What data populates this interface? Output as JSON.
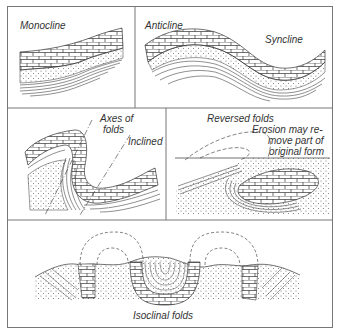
{
  "figure": {
    "panels": [
      {
        "id": "monocline",
        "labels": [
          "Monocline"
        ]
      },
      {
        "id": "anticline-syncline",
        "labels": [
          "Anticline",
          "Syncline"
        ]
      },
      {
        "id": "inclined",
        "labels": [
          "Axes of",
          "folds",
          "Inclined"
        ]
      },
      {
        "id": "reversed",
        "labels": [
          "Reversed folds",
          "Erosion may re-",
          "move part of",
          "original form"
        ]
      },
      {
        "id": "isoclinal",
        "labels": [
          "Isoclinal folds"
        ]
      }
    ],
    "colors": {
      "line": "#333333",
      "frame": "#777777",
      "background": "#ffffff"
    }
  }
}
